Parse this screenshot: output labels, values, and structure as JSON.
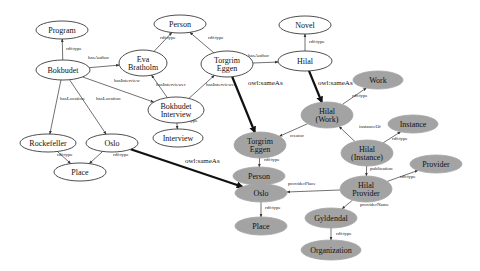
{
  "diagram": {
    "type": "rdf-graph",
    "colors": {
      "plain_node_fill": "#ffffff",
      "highlight_node_fill": "#a3a3a3",
      "edge": "#333333"
    },
    "nodes": [
      {
        "id": "program",
        "label": [
          "Program"
        ],
        "style": "white",
        "cx": 62,
        "cy": 30,
        "rx": 26,
        "ry": 9
      },
      {
        "id": "bokbudet",
        "label": [
          "Bokbudet"
        ],
        "style": "white",
        "cx": 63,
        "cy": 70,
        "rx": 27,
        "ry": 10
      },
      {
        "id": "eva",
        "label": [
          "Eva",
          "Bratholm"
        ],
        "style": "white",
        "cx": 143,
        "cy": 63,
        "rx": 24,
        "ry": 13
      },
      {
        "id": "person1",
        "label": [
          "Person"
        ],
        "style": "white",
        "cx": 180,
        "cy": 24,
        "rx": 26,
        "ry": 9
      },
      {
        "id": "torgrim1",
        "label": [
          "Torgrim",
          "Eggen"
        ],
        "style": "white",
        "cx": 227,
        "cy": 64,
        "rx": 26,
        "ry": 13
      },
      {
        "id": "bokint",
        "label": [
          "Bokbudet",
          "Interview"
        ],
        "style": "white",
        "cx": 176,
        "cy": 110,
        "rx": 28,
        "ry": 13
      },
      {
        "id": "interview",
        "label": [
          "Interview"
        ],
        "style": "white",
        "cx": 178,
        "cy": 138,
        "rx": 25,
        "ry": 9
      },
      {
        "id": "rockefeller",
        "label": [
          "Rockefeller"
        ],
        "style": "white",
        "cx": 48,
        "cy": 143,
        "rx": 28,
        "ry": 9
      },
      {
        "id": "oslo1",
        "label": [
          "Oslo"
        ],
        "style": "white",
        "cx": 112,
        "cy": 143,
        "rx": 26,
        "ry": 9
      },
      {
        "id": "place1",
        "label": [
          "Place"
        ],
        "style": "white",
        "cx": 80,
        "cy": 172,
        "rx": 26,
        "ry": 9
      },
      {
        "id": "novel",
        "label": [
          "Novel"
        ],
        "style": "white",
        "cx": 305,
        "cy": 25,
        "rx": 26,
        "ry": 9
      },
      {
        "id": "hilal1",
        "label": [
          "Hilal"
        ],
        "style": "white",
        "cx": 305,
        "cy": 61,
        "rx": 27,
        "ry": 10
      },
      {
        "id": "work",
        "label": [
          "Work"
        ],
        "style": "grey",
        "cx": 378,
        "cy": 80,
        "rx": 25,
        "ry": 9
      },
      {
        "id": "hilalwork",
        "label": [
          "Hilal",
          "(Work)"
        ],
        "style": "grey",
        "cx": 327,
        "cy": 115,
        "rx": 26,
        "ry": 13
      },
      {
        "id": "torgrim2",
        "label": [
          "Torgrim",
          "Eggen"
        ],
        "style": "grey",
        "cx": 260,
        "cy": 145,
        "rx": 26,
        "ry": 13
      },
      {
        "id": "person2",
        "label": [
          "Person"
        ],
        "style": "grey",
        "cx": 259,
        "cy": 176,
        "rx": 26,
        "ry": 9
      },
      {
        "id": "instance",
        "label": [
          "Instance"
        ],
        "style": "grey",
        "cx": 413,
        "cy": 124,
        "rx": 25,
        "ry": 9
      },
      {
        "id": "hilalinst",
        "label": [
          "Hilal",
          "(Instance)"
        ],
        "style": "grey",
        "cx": 367,
        "cy": 153,
        "rx": 26,
        "ry": 13
      },
      {
        "id": "provider",
        "label": [
          "Provider"
        ],
        "style": "grey",
        "cx": 436,
        "cy": 164,
        "rx": 26,
        "ry": 9
      },
      {
        "id": "hilalprov",
        "label": [
          "Hilal",
          "Provider"
        ],
        "style": "grey",
        "cx": 366,
        "cy": 189,
        "rx": 26,
        "ry": 13
      },
      {
        "id": "oslo2",
        "label": [
          "Oslo"
        ],
        "style": "grey",
        "cx": 261,
        "cy": 193,
        "rx": 26,
        "ry": 9
      },
      {
        "id": "place2",
        "label": [
          "Place"
        ],
        "style": "grey",
        "cx": 261,
        "cy": 226,
        "rx": 26,
        "ry": 9
      },
      {
        "id": "gyldendal",
        "label": [
          "Gyldendal"
        ],
        "style": "grey",
        "cx": 331,
        "cy": 218,
        "rx": 26,
        "ry": 10
      },
      {
        "id": "organization",
        "label": [
          "Organization"
        ],
        "style": "grey",
        "cx": 331,
        "cy": 250,
        "rx": 30,
        "ry": 10
      }
    ],
    "edges": [
      {
        "from": "bokbudet",
        "to": "program",
        "label": "rdf:type",
        "lx": 66,
        "ly": 50
      },
      {
        "from": "bokbudet",
        "to": "eva",
        "label": "hasAuthor",
        "lx": 88,
        "ly": 59
      },
      {
        "from": "bokbudet",
        "to": "bokint",
        "label": "hasInterview",
        "lx": 114,
        "ly": 82
      },
      {
        "from": "bokbudet",
        "to": "rockefeller",
        "label": "hasLocation",
        "lx": 60,
        "ly": 100
      },
      {
        "from": "bokbudet",
        "to": "oslo1",
        "label": "hasLocation",
        "lx": 96,
        "ly": 100
      },
      {
        "from": "eva",
        "to": "person1",
        "label": "rdf:type",
        "lx": 160,
        "ly": 39
      },
      {
        "from": "torgrim1",
        "to": "person1",
        "label": "rdf:type",
        "lx": 208,
        "ly": 39
      },
      {
        "from": "bokint",
        "to": "eva",
        "label": "hasInterviewer",
        "lx": 156,
        "ly": 86
      },
      {
        "from": "bokint",
        "to": "torgrim1",
        "label": "hasInterviewee",
        "lx": 206,
        "ly": 86
      },
      {
        "from": "bokint",
        "to": "interview",
        "label": "rdf:type",
        "lx": 182,
        "ly": 122
      },
      {
        "from": "rockefeller",
        "to": "place1",
        "label": "rdf:type",
        "lx": 57,
        "ly": 156
      },
      {
        "from": "oslo1",
        "to": "place1",
        "label": "rdf:type",
        "lx": 113,
        "ly": 156
      },
      {
        "from": "torgrim1",
        "to": "hilal1",
        "label": "hasAuthor",
        "lx": 248,
        "ly": 57
      },
      {
        "from": "hilal1",
        "to": "novel",
        "label": "rdf:type",
        "lx": 309,
        "ly": 43
      },
      {
        "from": "torgrim1",
        "to": "torgrim2",
        "label": "owl:sameAs",
        "lx": 248,
        "ly": 85,
        "bold": true
      },
      {
        "from": "hilal1",
        "to": "hilalwork",
        "label": "owl:sameAs",
        "lx": 318,
        "ly": 85,
        "bold": true
      },
      {
        "from": "oslo1",
        "to": "oslo2",
        "label": "owl:sameAs",
        "lx": 185,
        "ly": 163,
        "bold": true
      },
      {
        "from": "hilalwork",
        "to": "work",
        "label": "rdf:type",
        "lx": 352,
        "ly": 97
      },
      {
        "from": "hilalwork",
        "to": "torgrim2",
        "label": "creator",
        "lx": 290,
        "ly": 137
      },
      {
        "from": "torgrim2",
        "to": "person2",
        "label": "rdf:type",
        "lx": 264,
        "ly": 161
      },
      {
        "from": "hilalinst",
        "to": "hilalwork",
        "label": "instanceOf",
        "lx": 359,
        "ly": 128
      },
      {
        "from": "hilalinst",
        "to": "instance",
        "label": "rdf:type",
        "lx": 392,
        "ly": 140
      },
      {
        "from": "hilalinst",
        "to": "hilalprov",
        "label": "publication",
        "lx": 370,
        "ly": 170
      },
      {
        "from": "hilalprov",
        "to": "provider",
        "label": "rdf:type",
        "lx": 400,
        "ly": 178
      },
      {
        "from": "hilalprov",
        "to": "oslo2",
        "label": "providerPlace",
        "lx": 288,
        "ly": 185
      },
      {
        "from": "hilalprov",
        "to": "gyldendal",
        "label": "providerName",
        "lx": 360,
        "ly": 206
      },
      {
        "from": "oslo2",
        "to": "place2",
        "label": "rdf:type",
        "lx": 265,
        "ly": 209
      },
      {
        "from": "gyldendal",
        "to": "organization",
        "label": "rdf:type",
        "lx": 336,
        "ly": 235
      }
    ]
  }
}
